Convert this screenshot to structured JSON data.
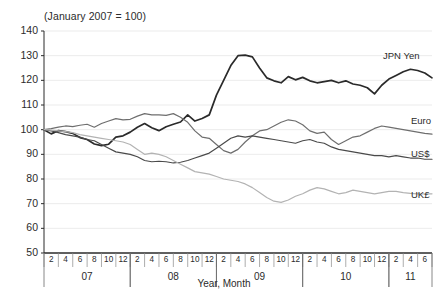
{
  "chart_data": {
    "type": "line",
    "title": "(January 2007 = 100)",
    "xlabel": "Year, Month",
    "ylabel": "",
    "ylim": [
      50,
      140
    ],
    "yticks": [
      50,
      60,
      70,
      80,
      90,
      100,
      110,
      120,
      130,
      140
    ],
    "grid": true,
    "legend_position": "right-inline",
    "x_group_label_1": "07",
    "x_group_label_2": "08",
    "x_group_label_3": "09",
    "x_group_label_4": "10",
    "x_group_label_5": "11",
    "month_ticks": [
      "2",
      "4",
      "6",
      "8",
      "10",
      "12",
      "2",
      "4",
      "6",
      "8",
      "10",
      "12",
      "2",
      "4",
      "6",
      "8",
      "10",
      "12",
      "2",
      "4",
      "6",
      "8",
      "10",
      "12",
      "2",
      "4",
      "6"
    ],
    "x": [
      "2007-01",
      "2007-02",
      "2007-03",
      "2007-04",
      "2007-05",
      "2007-06",
      "2007-07",
      "2007-08",
      "2007-09",
      "2007-10",
      "2007-11",
      "2007-12",
      "2008-01",
      "2008-02",
      "2008-03",
      "2008-04",
      "2008-05",
      "2008-06",
      "2008-07",
      "2008-08",
      "2008-09",
      "2008-10",
      "2008-11",
      "2008-12",
      "2009-01",
      "2009-02",
      "2009-03",
      "2009-04",
      "2009-05",
      "2009-06",
      "2009-07",
      "2009-08",
      "2009-09",
      "2009-10",
      "2009-11",
      "2009-12",
      "2010-01",
      "2010-02",
      "2010-03",
      "2010-04",
      "2010-05",
      "2010-06",
      "2010-07",
      "2010-08",
      "2010-09",
      "2010-10",
      "2010-11",
      "2010-12",
      "2011-01",
      "2011-02",
      "2011-03",
      "2011-04",
      "2011-05",
      "2011-06",
      "2011-07"
    ],
    "series": [
      {
        "name": "JPN Yen",
        "color": "#2a2a2a",
        "values": [
          100.0,
          98.3,
          99.6,
          99.2,
          98.5,
          96.8,
          96.0,
          94.2,
          93.5,
          94.1,
          97.0,
          97.5,
          99.0,
          101.0,
          102.5,
          100.8,
          99.6,
          101.2,
          102.2,
          103.1,
          106.0,
          103.5,
          104.5,
          106.0,
          114.0,
          120.0,
          126.0,
          130.0,
          130.2,
          129.5,
          125.0,
          121.0,
          119.8,
          119.0,
          121.5,
          120.2,
          121.2,
          119.8,
          119.0,
          119.5,
          120.0,
          119.0,
          119.8,
          118.5,
          118.0,
          117.0,
          114.5,
          118.0,
          120.5,
          122.0,
          123.5,
          124.5,
          124.0,
          123.0,
          121.0
        ]
      },
      {
        "name": "Euro",
        "color": "#6e6e6e",
        "values": [
          100.0,
          100.4,
          101.0,
          101.5,
          101.2,
          101.8,
          102.2,
          101.0,
          102.5,
          103.5,
          104.5,
          104.0,
          104.2,
          105.5,
          106.5,
          106.0,
          106.0,
          105.8,
          106.5,
          105.0,
          103.0,
          99.5,
          97.0,
          96.5,
          94.0,
          91.5,
          90.5,
          92.0,
          95.0,
          97.5,
          99.5,
          100.0,
          101.5,
          103.0,
          104.0,
          103.5,
          102.0,
          99.5,
          98.5,
          99.0,
          96.0,
          94.0,
          95.5,
          97.0,
          97.5,
          99.0,
          100.5,
          101.5,
          101.0,
          100.5,
          100.0,
          99.5,
          99.0,
          98.5,
          98.2
        ]
      },
      {
        "name": "US$",
        "color": "#4a4a4a",
        "values": [
          100.0,
          99.5,
          98.8,
          98.0,
          97.5,
          97.0,
          96.0,
          95.5,
          94.0,
          92.5,
          91.0,
          90.5,
          90.0,
          89.0,
          87.5,
          87.0,
          87.2,
          87.0,
          86.5,
          86.8,
          87.5,
          88.5,
          89.5,
          90.5,
          92.5,
          94.5,
          96.5,
          97.5,
          97.0,
          97.5,
          97.0,
          96.5,
          96.0,
          95.5,
          95.0,
          94.5,
          95.5,
          96.0,
          95.0,
          94.5,
          93.0,
          92.0,
          91.5,
          91.0,
          90.5,
          90.0,
          89.5,
          89.5,
          89.0,
          89.5,
          89.0,
          88.5,
          88.5,
          88.0,
          88.0
        ]
      },
      {
        "name": "UK£",
        "color": "#b3b3b3",
        "values": [
          100.0,
          99.8,
          99.5,
          99.2,
          98.8,
          98.0,
          97.5,
          97.0,
          96.5,
          96.0,
          95.5,
          95.0,
          94.0,
          92.0,
          90.0,
          90.5,
          90.0,
          89.0,
          87.5,
          86.0,
          84.5,
          83.0,
          82.5,
          82.0,
          81.0,
          80.0,
          79.5,
          79.0,
          78.0,
          76.5,
          74.5,
          72.5,
          71.0,
          70.5,
          71.5,
          73.0,
          74.0,
          75.5,
          76.5,
          76.0,
          75.0,
          74.0,
          74.5,
          75.5,
          75.0,
          74.5,
          74.0,
          74.5,
          75.0,
          75.0,
          74.5,
          74.2,
          74.0,
          74.0,
          74.0
        ]
      }
    ]
  },
  "labels": {
    "jpn": "JPN Yen",
    "euro": "Euro",
    "usd": "US$",
    "gbp": "UK£"
  }
}
